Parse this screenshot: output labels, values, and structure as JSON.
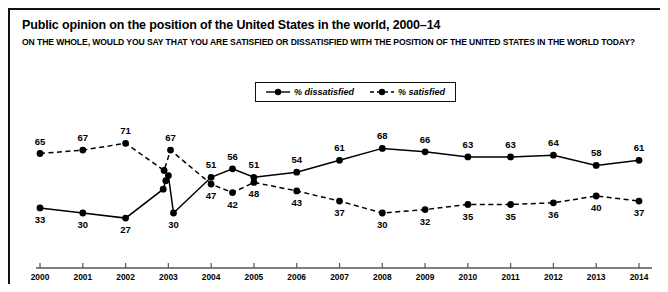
{
  "figure": {
    "title": "Public opinion on the position of the United States in the world, 2000–14",
    "subtitle": "ON THE WHOLE, WOULD YOU SAY THAT YOU ARE SATISFIED OR DISSATISFIED WITH THE POSITION OF THE UNITED STATES IN THE WORLD TODAY?"
  },
  "legend": {
    "position": "top-center",
    "entries": [
      {
        "label": "% dissatisfied",
        "style": "solid",
        "marker": "filled-circle",
        "color": "#000000"
      },
      {
        "label": "% satisfied",
        "style": "dashed",
        "marker": "filled-circle",
        "color": "#000000"
      }
    ]
  },
  "chart_data": {
    "type": "line",
    "title": "Public opinion on the position of the United States in the world, 2000–14",
    "subtitle": "ON THE WHOLE, WOULD YOU SAY THAT YOU ARE SATISFIED OR DISSATISFIED WITH THE POSITION OF THE UNITED STATES IN THE WORLD TODAY?",
    "xlabel": "",
    "ylabel": "",
    "ylim": [
      0,
      80
    ],
    "grid": false,
    "legend_position": "top-center",
    "categories": [
      "2000",
      "2001",
      "2002",
      "2003",
      "2004",
      "2005",
      "2006",
      "2007",
      "2008",
      "2009",
      "2010",
      "2011",
      "2012",
      "2013",
      "2014"
    ],
    "series": [
      {
        "name": "% dissatisfied",
        "style": "solid",
        "points": [
          {
            "x": 2000.0,
            "y": 33,
            "label": "33",
            "label_pos": "below"
          },
          {
            "x": 2001.0,
            "y": 30,
            "label": "30",
            "label_pos": "below"
          },
          {
            "x": 2002.0,
            "y": 27,
            "label": "27",
            "label_pos": "below"
          },
          {
            "x": 2002.88,
            "y": 44,
            "label": "",
            "label_pos": "none"
          },
          {
            "x": 2002.94,
            "y": 49,
            "label": "",
            "label_pos": "none"
          },
          {
            "x": 2003.0,
            "y": 52,
            "label": "",
            "label_pos": "none"
          },
          {
            "x": 2003.12,
            "y": 30,
            "label": "30",
            "label_pos": "below"
          },
          {
            "x": 2004.0,
            "y": 51,
            "label": "51",
            "label_pos": "above"
          },
          {
            "x": 2004.5,
            "y": 56,
            "label": "56",
            "label_pos": "above"
          },
          {
            "x": 2005.0,
            "y": 51,
            "label": "51",
            "label_pos": "above"
          },
          {
            "x": 2006.0,
            "y": 54,
            "label": "54",
            "label_pos": "above"
          },
          {
            "x": 2007.0,
            "y": 61,
            "label": "61",
            "label_pos": "above"
          },
          {
            "x": 2008.0,
            "y": 68,
            "label": "68",
            "label_pos": "above"
          },
          {
            "x": 2009.0,
            "y": 66,
            "label": "66",
            "label_pos": "above"
          },
          {
            "x": 2010.0,
            "y": 63,
            "label": "63",
            "label_pos": "above"
          },
          {
            "x": 2011.0,
            "y": 63,
            "label": "63",
            "label_pos": "above"
          },
          {
            "x": 2012.0,
            "y": 64,
            "label": "64",
            "label_pos": "above"
          },
          {
            "x": 2013.0,
            "y": 58,
            "label": "58",
            "label_pos": "above"
          },
          {
            "x": 2014.0,
            "y": 61,
            "label": "61",
            "label_pos": "above"
          }
        ]
      },
      {
        "name": "% satisfied",
        "style": "dashed",
        "points": [
          {
            "x": 2000.0,
            "y": 65,
            "label": "65",
            "label_pos": "above"
          },
          {
            "x": 2001.0,
            "y": 67,
            "label": "67",
            "label_pos": "above"
          },
          {
            "x": 2002.0,
            "y": 71,
            "label": "71",
            "label_pos": "above"
          },
          {
            "x": 2002.9,
            "y": 55,
            "label": "",
            "label_pos": "none"
          },
          {
            "x": 2003.05,
            "y": 67,
            "label": "67",
            "label_pos": "above"
          },
          {
            "x": 2004.0,
            "y": 47,
            "label": "47",
            "label_pos": "below"
          },
          {
            "x": 2004.5,
            "y": 42,
            "label": "42",
            "label_pos": "below"
          },
          {
            "x": 2005.0,
            "y": 48,
            "label": "48",
            "label_pos": "below"
          },
          {
            "x": 2006.0,
            "y": 43,
            "label": "43",
            "label_pos": "below"
          },
          {
            "x": 2007.0,
            "y": 37,
            "label": "37",
            "label_pos": "below"
          },
          {
            "x": 2008.0,
            "y": 30,
            "label": "30",
            "label_pos": "below"
          },
          {
            "x": 2009.0,
            "y": 32,
            "label": "32",
            "label_pos": "below"
          },
          {
            "x": 2010.0,
            "y": 35,
            "label": "35",
            "label_pos": "below"
          },
          {
            "x": 2011.0,
            "y": 35,
            "label": "35",
            "label_pos": "below"
          },
          {
            "x": 2012.0,
            "y": 36,
            "label": "36",
            "label_pos": "below"
          },
          {
            "x": 2013.0,
            "y": 40,
            "label": "40",
            "label_pos": "below"
          },
          {
            "x": 2014.0,
            "y": 37,
            "label": "37",
            "label_pos": "below"
          }
        ]
      }
    ]
  }
}
